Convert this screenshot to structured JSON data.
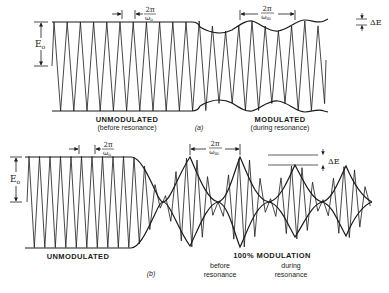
{
  "figure": {
    "panel_a": {
      "tag": "(a)",
      "amplitude_label": "E",
      "amplitude_sub": "o",
      "carrier_period_num": "2π",
      "carrier_period_den": "ω",
      "carrier_period_den_sub": "o",
      "mod_period_num": "2π",
      "mod_period_den": "ω",
      "mod_period_den_sub": "m",
      "delta_label": "ΔE",
      "left_title": "UNMODULATED",
      "left_subtitle": "(before resonance)",
      "right_title": "MODULATED",
      "right_subtitle": "(during resonance)"
    },
    "panel_b": {
      "tag": "(b)",
      "amplitude_label": "E",
      "amplitude_sub": "o",
      "carrier_period_num": "2π",
      "carrier_period_den": "ω",
      "carrier_period_den_sub": "o",
      "mod_period_num": "2π",
      "mod_period_den": "ω",
      "mod_period_den_sub": "m",
      "delta_label": "ΔE",
      "left_title": "UNMODULATED",
      "center_title": "100% MODULATION",
      "before_label_1": "before",
      "before_label_2": "resonance",
      "during_label_1": "during",
      "during_label_2": "resonance"
    }
  },
  "colors": {
    "ink": "#1a1a1a",
    "background": "#ffffff"
  }
}
